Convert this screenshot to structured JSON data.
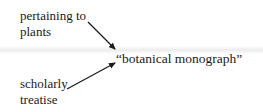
{
  "diagram": {
    "target": "“botanical monograph”",
    "sources": [
      {
        "lines": [
          "pertaining to",
          "plants"
        ],
        "arrow_to": "target"
      },
      {
        "lines": [
          "scholarly",
          "treatise"
        ],
        "arrow_to": "target"
      }
    ]
  },
  "colors": {
    "text": "#1a1a1a",
    "arrow": "#1a1a1a",
    "background": "#ffffff",
    "band": "#ececec"
  }
}
